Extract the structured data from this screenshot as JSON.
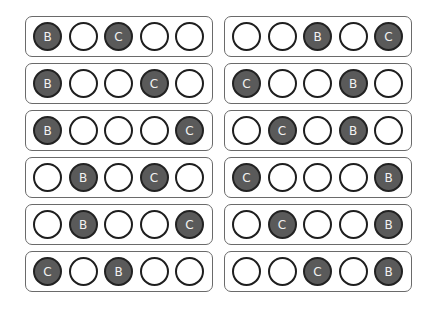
{
  "colors": {
    "filled": "#5a5a5a",
    "empty": "#ffffff",
    "outline": "#1e1e1e",
    "label": "#f2f2f2",
    "box_border": "#6a6a6a"
  },
  "left_column": [
    {
      "cells": [
        "B",
        "",
        "C",
        "",
        ""
      ]
    },
    {
      "cells": [
        "B",
        "",
        "",
        "C",
        ""
      ]
    },
    {
      "cells": [
        "B",
        "",
        "",
        "",
        "C"
      ]
    },
    {
      "cells": [
        "",
        "B",
        "",
        "C",
        ""
      ]
    },
    {
      "cells": [
        "",
        "B",
        "",
        "",
        "C"
      ]
    },
    {
      "cells": [
        "C",
        "",
        "B",
        "",
        ""
      ]
    }
  ],
  "right_column": [
    {
      "cells": [
        "",
        "",
        "B",
        "",
        "C"
      ]
    },
    {
      "cells": [
        "C",
        "",
        "",
        "B",
        ""
      ]
    },
    {
      "cells": [
        "",
        "C",
        "",
        "B",
        ""
      ]
    },
    {
      "cells": [
        "C",
        "",
        "",
        "",
        "B"
      ]
    },
    {
      "cells": [
        "",
        "C",
        "",
        "",
        "B"
      ]
    },
    {
      "cells": [
        "",
        "",
        "C",
        "",
        "B"
      ]
    }
  ]
}
